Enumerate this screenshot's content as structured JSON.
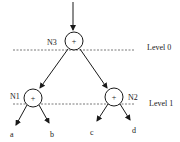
{
  "diagram": {
    "type": "binary-tree",
    "levels": [
      {
        "label": "Level 0",
        "y": 50
      },
      {
        "label": "Level 1",
        "y": 104
      }
    ],
    "nodes": [
      {
        "id": "N3",
        "label": "N3",
        "op": "+",
        "cx": 74,
        "cy": 41
      },
      {
        "id": "N1",
        "label": "N1",
        "op": "+",
        "cx": 33,
        "cy": 98
      },
      {
        "id": "N2",
        "label": "N2",
        "op": "+",
        "cx": 114,
        "cy": 97
      }
    ],
    "leaves": [
      {
        "label": "a"
      },
      {
        "label": "b"
      },
      {
        "label": "c"
      },
      {
        "label": "d"
      }
    ],
    "colors": {
      "stroke": "#1a1a1a",
      "dash": "#555555"
    }
  }
}
